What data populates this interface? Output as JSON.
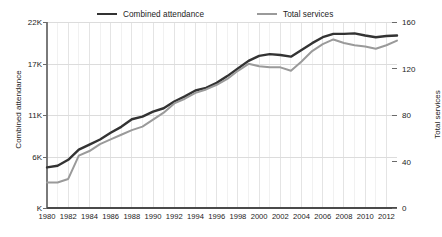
{
  "chart_data": {
    "type": "line",
    "title": "",
    "subtitle": "",
    "xlabel": "",
    "ylabel": "Combined attendance",
    "y2label": "Total services",
    "grid": true,
    "legend_position": "top",
    "xlim": [
      1980,
      2013
    ],
    "ylim": [
      0,
      22000
    ],
    "y2lim": [
      0,
      160
    ],
    "x": [
      1980,
      1981,
      1982,
      1983,
      1984,
      1985,
      1986,
      1987,
      1988,
      1989,
      1990,
      1991,
      1992,
      1993,
      1994,
      1995,
      1996,
      1997,
      1998,
      1999,
      2000,
      2001,
      2002,
      2003,
      2004,
      2005,
      2006,
      2007,
      2008,
      2009,
      2010,
      2011,
      2012,
      2013
    ],
    "xtick_labels": [
      "1980",
      "1982",
      "1984",
      "1986",
      "1988",
      "1990",
      "1992",
      "1994",
      "1996",
      "1998",
      "2000",
      "2002",
      "2004",
      "2006",
      "2008",
      "2010",
      "2012"
    ],
    "xtick_values": [
      1980,
      1982,
      1984,
      1986,
      1988,
      1990,
      1992,
      1994,
      1996,
      1998,
      2000,
      2002,
      2004,
      2006,
      2008,
      2010,
      2012
    ],
    "ytick_labels_left": [
      "22K",
      "17K",
      "11K",
      "6K",
      "K"
    ],
    "ytick_values_left": [
      22000,
      17000,
      11000,
      6000,
      0
    ],
    "ytick_labels_right": [
      "160",
      "120",
      "80",
      "40",
      "0"
    ],
    "ytick_values_right": [
      160,
      120,
      80,
      40,
      0
    ],
    "series": [
      {
        "name": "Combined attendance",
        "axis": "left",
        "color": "#333333",
        "width": 2.4,
        "values": [
          4800,
          5000,
          5700,
          6900,
          7500,
          8100,
          8900,
          9600,
          10500,
          10800,
          11400,
          11800,
          12600,
          13200,
          13900,
          14200,
          14800,
          15600,
          16500,
          17400,
          18000,
          18200,
          18100,
          17900,
          18700,
          19500,
          20200,
          20600,
          20600,
          20650,
          20400,
          20200,
          20350,
          20400
        ]
      },
      {
        "name": "Total services",
        "axis": "right",
        "color": "#9a9a9a",
        "width": 2.0,
        "values": [
          22,
          22,
          25,
          45,
          49,
          55,
          59,
          63,
          67,
          70,
          76,
          82,
          90,
          94,
          99,
          102,
          106,
          111,
          118,
          124,
          122,
          121,
          121,
          118,
          126,
          135,
          141,
          145,
          142,
          140,
          139,
          137,
          140,
          144
        ]
      }
    ]
  },
  "legend": {
    "entries": [
      {
        "label": "Combined attendance",
        "color": "#333333"
      },
      {
        "label": "Total services",
        "color": "#9a9a9a"
      }
    ]
  },
  "axes": {
    "left_title": "Combined attendance",
    "right_title": "Total services"
  }
}
